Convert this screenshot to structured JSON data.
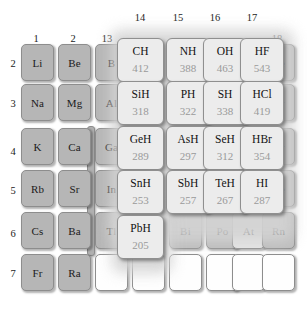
{
  "figure": {
    "type": "periodic-table-overlay"
  },
  "group_headers": [
    {
      "label": "1",
      "x": 36,
      "y": 33
    },
    {
      "label": "2",
      "x": 73,
      "y": 33
    },
    {
      "label": "13",
      "x": 107,
      "y": 33
    },
    {
      "label": "14",
      "x": 140,
      "y": 12
    },
    {
      "label": "15",
      "x": 178,
      "y": 12
    },
    {
      "label": "16",
      "x": 215,
      "y": 12
    },
    {
      "label": "17",
      "x": 252,
      "y": 12
    },
    {
      "label": "18",
      "x": 277,
      "y": 33
    }
  ],
  "period_headers": [
    {
      "label": "2",
      "y": 58
    },
    {
      "label": "3",
      "y": 98
    },
    {
      "label": "4",
      "y": 146
    },
    {
      "label": "5",
      "y": 185
    },
    {
      "label": "6",
      "y": 228
    },
    {
      "label": "7",
      "y": 268
    }
  ],
  "base_cells": [
    {
      "symbol": "Li",
      "x": 21,
      "y": 44,
      "tone": "gray"
    },
    {
      "symbol": "Be",
      "x": 58,
      "y": 44,
      "tone": "gray"
    },
    {
      "symbol": "B",
      "x": 95,
      "y": 44,
      "tone": "gray"
    },
    {
      "symbol": "Ne",
      "x": 262,
      "y": 44,
      "tone": "gray2"
    },
    {
      "symbol": "Na",
      "x": 21,
      "y": 84,
      "tone": "gray"
    },
    {
      "symbol": "Mg",
      "x": 58,
      "y": 84,
      "tone": "gray"
    },
    {
      "symbol": "Al",
      "x": 95,
      "y": 84,
      "tone": "gray"
    },
    {
      "symbol": "Ar",
      "x": 262,
      "y": 84,
      "tone": "gray2"
    },
    {
      "symbol": "K",
      "x": 21,
      "y": 128,
      "tone": "gray"
    },
    {
      "symbol": "Ca",
      "x": 58,
      "y": 128,
      "tone": "gray"
    },
    {
      "symbol": "Ga",
      "x": 95,
      "y": 128,
      "tone": "gray"
    },
    {
      "symbol": "Kr",
      "x": 262,
      "y": 128,
      "tone": "gray2"
    },
    {
      "symbol": "Rb",
      "x": 21,
      "y": 170,
      "tone": "gray"
    },
    {
      "symbol": "Sr",
      "x": 58,
      "y": 170,
      "tone": "gray"
    },
    {
      "symbol": "In",
      "x": 95,
      "y": 170,
      "tone": "gray"
    },
    {
      "symbol": "Xe",
      "x": 262,
      "y": 170,
      "tone": "gray2"
    },
    {
      "symbol": "Cs",
      "x": 21,
      "y": 212,
      "tone": "gray"
    },
    {
      "symbol": "Ba",
      "x": 58,
      "y": 212,
      "tone": "gray"
    },
    {
      "symbol": "Tl",
      "x": 95,
      "y": 212,
      "tone": "gray"
    },
    {
      "symbol": "Bi",
      "x": 169,
      "y": 212,
      "tone": "gray2"
    },
    {
      "symbol": "Po",
      "x": 206,
      "y": 212,
      "tone": "gray2"
    },
    {
      "symbol": "At",
      "x": 232,
      "y": 212,
      "tone": "light"
    },
    {
      "symbol": "Rn",
      "x": 262,
      "y": 212,
      "tone": "gray2"
    },
    {
      "symbol": "Fr",
      "x": 21,
      "y": 254,
      "tone": "gray"
    },
    {
      "symbol": "Ra",
      "x": 58,
      "y": 254,
      "tone": "gray"
    },
    {
      "symbol": "",
      "x": 95,
      "y": 254,
      "tone": "empty"
    },
    {
      "symbol": "",
      "x": 132,
      "y": 254,
      "tone": "empty"
    },
    {
      "symbol": "",
      "x": 169,
      "y": 254,
      "tone": "empty"
    },
    {
      "symbol": "",
      "x": 206,
      "y": 254,
      "tone": "empty"
    },
    {
      "symbol": "",
      "x": 232,
      "y": 254,
      "tone": "empty"
    },
    {
      "symbol": "",
      "x": 262,
      "y": 254,
      "tone": "empty"
    }
  ],
  "overlay_cells": [
    {
      "formula": "CH",
      "energy": "412",
      "x": 117,
      "y": 38,
      "w": 47,
      "h": 44
    },
    {
      "formula": "NH",
      "energy": "388",
      "x": 166,
      "y": 38,
      "w": 44,
      "h": 44
    },
    {
      "formula": "OH",
      "energy": "463",
      "x": 203,
      "y": 38,
      "w": 44,
      "h": 44
    },
    {
      "formula": "HF",
      "energy": "543",
      "x": 240,
      "y": 38,
      "w": 44,
      "h": 44
    },
    {
      "formula": "SiH",
      "energy": "318",
      "x": 117,
      "y": 81,
      "w": 47,
      "h": 44
    },
    {
      "formula": "PH",
      "energy": "322",
      "x": 166,
      "y": 81,
      "w": 44,
      "h": 44
    },
    {
      "formula": "SH",
      "energy": "338",
      "x": 203,
      "y": 81,
      "w": 44,
      "h": 44
    },
    {
      "formula": "HCl",
      "energy": "419",
      "x": 240,
      "y": 81,
      "w": 44,
      "h": 44
    },
    {
      "formula": "GeH",
      "energy": "289",
      "x": 117,
      "y": 126,
      "w": 47,
      "h": 44
    },
    {
      "formula": "AsH",
      "energy": "297",
      "x": 166,
      "y": 126,
      "w": 44,
      "h": 44
    },
    {
      "formula": "SeH",
      "energy": "312",
      "x": 203,
      "y": 126,
      "w": 44,
      "h": 44
    },
    {
      "formula": "HBr",
      "energy": "354",
      "x": 240,
      "y": 126,
      "w": 44,
      "h": 44
    },
    {
      "formula": "SnH",
      "energy": "253",
      "x": 117,
      "y": 170,
      "w": 47,
      "h": 44
    },
    {
      "formula": "SbH",
      "energy": "257",
      "x": 166,
      "y": 170,
      "w": 44,
      "h": 44
    },
    {
      "formula": "TeH",
      "energy": "267",
      "x": 203,
      "y": 170,
      "w": 44,
      "h": 44
    },
    {
      "formula": "HI",
      "energy": "287",
      "x": 240,
      "y": 170,
      "w": 44,
      "h": 44
    },
    {
      "formula": "PbH",
      "energy": "205",
      "x": 117,
      "y": 215,
      "w": 47,
      "h": 44
    }
  ],
  "chart_data": {
    "type": "heatmap",
    "title": "",
    "xlabel": "Group",
    "ylabel": "Period",
    "categories": [
      "14",
      "15",
      "16",
      "17"
    ],
    "rows": [
      "2",
      "3",
      "4",
      "5",
      "6"
    ],
    "series": [
      {
        "name": "Period 2",
        "labels": [
          "CH",
          "NH",
          "OH",
          "HF"
        ],
        "values": [
          412,
          388,
          463,
          543
        ]
      },
      {
        "name": "Period 3",
        "labels": [
          "SiH",
          "PH",
          "SH",
          "HCl"
        ],
        "values": [
          318,
          322,
          338,
          419
        ]
      },
      {
        "name": "Period 4",
        "labels": [
          "GeH",
          "AsH",
          "SeH",
          "HBr"
        ],
        "values": [
          289,
          297,
          312,
          354
        ]
      },
      {
        "name": "Period 5",
        "labels": [
          "SnH",
          "SbH",
          "TeH",
          "HI"
        ],
        "values": [
          253,
          257,
          267,
          287
        ]
      },
      {
        "name": "Period 6",
        "labels": [
          "PbH",
          null,
          null,
          null
        ],
        "values": [
          205,
          null,
          null,
          null
        ]
      }
    ],
    "unit": "kJ/mol",
    "grid": false,
    "legend": "none"
  },
  "colors": {
    "base_cell": "#b6b6b6",
    "noble_cell": "#bdbdbd",
    "overlay_cell": "#ececec",
    "overlay_text": "#121212",
    "energy_text": "#9a9a9a",
    "border": "#8d8d8d",
    "background": "#ffffff"
  }
}
